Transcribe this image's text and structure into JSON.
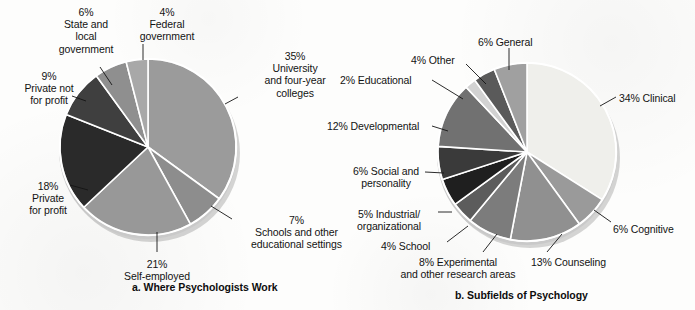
{
  "charts": [
    {
      "id": "where-psychologists-work",
      "caption": "a. Where Psychologists Work",
      "caption_left": 132,
      "caption_top": 281,
      "center": {
        "x": 148,
        "y": 147
      },
      "radius": 88,
      "start_angle": 0,
      "slices": [
        {
          "name": "university-and-four-year-colleges",
          "percent": 35,
          "color": "#9b9b9b",
          "label": "35%\nUniversity\nand four-year\ncolleges",
          "label_x": 247,
          "label_y": 50,
          "label_w": 96,
          "align": "c",
          "leader": {
            "x1": 225,
            "y1": 104,
            "x2": 238,
            "y2": 97
          }
        },
        {
          "name": "schools-and-other-educational-settings",
          "percent": 7,
          "color": "#8d8d8d",
          "label": "7%\nSchools and other\neducational settings",
          "label_x": 239,
          "label_y": 214,
          "label_w": 115,
          "align": "c",
          "leader": {
            "x1": 211,
            "y1": 206,
            "x2": 232,
            "y2": 219
          }
        },
        {
          "name": "self-employed",
          "percent": 21,
          "color": "#989898",
          "label": "21%\nSelf-employed",
          "label_x": 112,
          "label_y": 258,
          "label_w": 90,
          "align": "c",
          "leader": {
            "x1": 157,
            "y1": 232,
            "x2": 157,
            "y2": 252
          }
        },
        {
          "name": "private-for-profit",
          "percent": 18,
          "color": "#2a2a2a",
          "label": "18%\nPrivate\nfor profit",
          "label_x": 10,
          "label_y": 180,
          "label_w": 76,
          "align": "c",
          "leader": {
            "x1": 88,
            "y1": 190,
            "x2": 70,
            "y2": 185
          }
        },
        {
          "name": "private-not-for-profit",
          "percent": 9,
          "color": "#3f3f3f",
          "label": "9%\nPrivate not\nfor profit",
          "label_x": 6,
          "label_y": 70,
          "label_w": 86,
          "align": "c",
          "leader": {
            "x1": 86,
            "y1": 101,
            "x2": 72,
            "y2": 96
          }
        },
        {
          "name": "state-and-local-government",
          "percent": 6,
          "color": "#8f8f8f",
          "label": "6%\nState and\nlocal\ngovernment",
          "label_x": 43,
          "label_y": 6,
          "label_w": 86,
          "align": "c",
          "leader": {
            "x1": 112,
            "y1": 85,
            "x2": 100,
            "y2": 67
          }
        },
        {
          "name": "federal-government",
          "percent": 4,
          "color": "#a8a8a8",
          "label": "4%\nFederal\ngovernment",
          "label_x": 124,
          "label_y": 6,
          "label_w": 86,
          "align": "c",
          "leader": {
            "x1": 143,
            "y1": 60,
            "x2": 143,
            "y2": 44
          }
        }
      ]
    },
    {
      "id": "subfields-of-psychology",
      "caption": "b. Subfields of Psychology",
      "caption_left": 455,
      "caption_top": 289,
      "center": {
        "x": 527,
        "y": 152
      },
      "radius": 89,
      "start_angle": 0,
      "slices": [
        {
          "name": "clinical",
          "percent": 34,
          "color": "#efefeb",
          "label": "34% Clinical",
          "label_x": 619,
          "label_y": 92,
          "label_w": 76,
          "align": "l",
          "leader": {
            "x1": 600,
            "y1": 106,
            "x2": 616,
            "y2": 97
          }
        },
        {
          "name": "cognitive",
          "percent": 6,
          "color": "#9a9a9a",
          "label": "6% Cognitive",
          "label_x": 613,
          "label_y": 223,
          "label_w": 80,
          "align": "l",
          "leader": {
            "x1": 594,
            "y1": 210,
            "x2": 611,
            "y2": 222
          }
        },
        {
          "name": "counseling",
          "percent": 13,
          "color": "#909090",
          "label": "13% Counseling",
          "label_x": 531,
          "label_y": 256,
          "label_w": 92,
          "align": "l",
          "leader": {
            "x1": 562,
            "y1": 234,
            "x2": 547,
            "y2": 252
          }
        },
        {
          "name": "experimental-and-other-research-areas",
          "percent": 8,
          "color": "#7c7c7c",
          "label": "8% Experimental\nand other research areas",
          "label_x": 383,
          "label_y": 256,
          "label_w": 150,
          "align": "c",
          "leader": {
            "x1": 497,
            "y1": 234,
            "x2": 483,
            "y2": 252
          }
        },
        {
          "name": "school",
          "percent": 4,
          "color": "#5c5c5c",
          "label": "4% School",
          "label_x": 381,
          "label_y": 240,
          "label_w": 62,
          "align": "l",
          "leader": {
            "x1": 468,
            "y1": 226,
            "x2": 447,
            "y2": 242
          }
        },
        {
          "name": "industrial-organizational",
          "percent": 5,
          "color": "#1f1f1f",
          "label": "5% Industrial/\norganizational",
          "label_x": 339,
          "label_y": 208,
          "label_w": 100,
          "align": "c",
          "leader": {
            "x1": 452,
            "y1": 212,
            "x2": 438,
            "y2": 212
          }
        },
        {
          "name": "social-and-personality",
          "percent": 6,
          "color": "#3a3a3a",
          "label": "6% Social and\npersonality",
          "label_x": 336,
          "label_y": 165,
          "label_w": 100,
          "align": "c",
          "leader": {
            "x1": 444,
            "y1": 173,
            "x2": 425,
            "y2": 172
          }
        },
        {
          "name": "developmental",
          "percent": 12,
          "color": "#717171",
          "label": "12% Developmental",
          "label_x": 327,
          "label_y": 120,
          "label_w": 110,
          "align": "l",
          "leader": {
            "x1": 448,
            "y1": 131,
            "x2": 432,
            "y2": 126
          }
        },
        {
          "name": "educational",
          "percent": 2,
          "color": "#d2d2d2",
          "label": "2% Educational",
          "label_x": 340,
          "label_y": 74,
          "label_w": 86,
          "align": "l",
          "leader": {
            "x1": 463,
            "y1": 99,
            "x2": 432,
            "y2": 80
          }
        },
        {
          "name": "other",
          "percent": 4,
          "color": "#5a5a5a",
          "label": "4% Other",
          "label_x": 411,
          "label_y": 54,
          "label_w": 58,
          "align": "l",
          "leader": {
            "x1": 486,
            "y1": 84,
            "x2": 466,
            "y2": 64
          }
        },
        {
          "name": "general",
          "percent": 6,
          "color": "#a0a0a0",
          "label": "6% General",
          "label_x": 478,
          "label_y": 36,
          "label_w": 70,
          "align": "l",
          "leader": {
            "x1": 509,
            "y1": 70,
            "x2": 509,
            "y2": 48
          }
        }
      ]
    }
  ],
  "chart_data": [
    {
      "type": "pie",
      "title": "a. Where Psychologists Work",
      "categories": [
        "University and four-year colleges",
        "Schools and other educational settings",
        "Self-employed",
        "Private for profit",
        "Private not for profit",
        "State and local government",
        "Federal government"
      ],
      "values": [
        35,
        7,
        21,
        18,
        9,
        6,
        4
      ],
      "unit": "percent",
      "colors": [
        "#9b9b9b",
        "#8d8d8d",
        "#989898",
        "#2a2a2a",
        "#3f3f3f",
        "#8f8f8f",
        "#a8a8a8"
      ],
      "legend": "labels-with-leader-lines",
      "start_angle_deg": 0,
      "direction": "clockwise",
      "total": 100
    },
    {
      "type": "pie",
      "title": "b. Subfields of Psychology",
      "categories": [
        "Clinical",
        "Cognitive",
        "Counseling",
        "Experimental and other research areas",
        "School",
        "Industrial/organizational",
        "Social and personality",
        "Developmental",
        "Educational",
        "Other",
        "General"
      ],
      "values": [
        34,
        6,
        13,
        8,
        4,
        5,
        6,
        12,
        2,
        4,
        6
      ],
      "unit": "percent",
      "colors": [
        "#efefeb",
        "#9a9a9a",
        "#909090",
        "#7c7c7c",
        "#5c5c5c",
        "#1f1f1f",
        "#3a3a3a",
        "#717171",
        "#d2d2d2",
        "#5a5a5a",
        "#a0a0a0"
      ],
      "legend": "labels-with-leader-lines",
      "start_angle_deg": 0,
      "direction": "clockwise",
      "total": 100
    }
  ]
}
